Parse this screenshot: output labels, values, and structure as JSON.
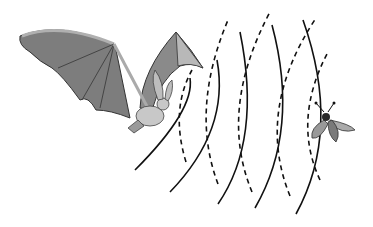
{
  "figure": {
    "description": "Bat using echolocation: emitted sound waves travel toward a moth and echoes return",
    "caption": ""
  },
  "elements": {
    "bat": {
      "label": "bat",
      "wing_color": "#7a7a7a",
      "wing_light": "#a8a8a8",
      "body_color": "#c9c9c9"
    },
    "moth": {
      "label": "moth",
      "wing_color": "#8c8c8c",
      "body_color": "#2a2a2a"
    },
    "emitted_waves": {
      "label": "emitted sound waves",
      "style": "solid",
      "count": 5,
      "color": "#111111"
    },
    "echo_waves": {
      "label": "echo waves",
      "style": "dashed",
      "count": 5,
      "color": "#111111"
    }
  },
  "colors": {
    "background": "#ffffff",
    "line": "#111111"
  }
}
